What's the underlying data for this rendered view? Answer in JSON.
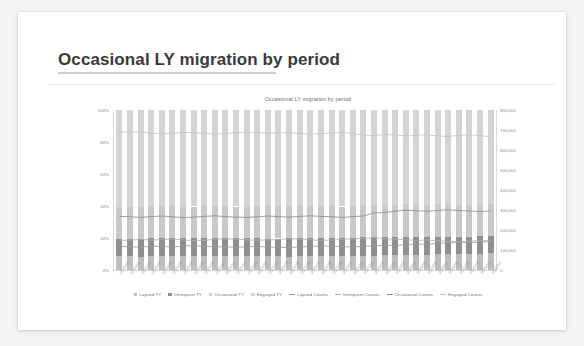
{
  "slide": {
    "title": "Occasional LY migration by period"
  },
  "chart_data": {
    "type": "bar",
    "title": "Occasional LY migration by period",
    "xlabel": "",
    "ylabel": "",
    "stacked": true,
    "grid": false,
    "legend_position": "bottom",
    "y_left": {
      "ticks": [
        "100%",
        "80%",
        "60%",
        "40%",
        "20%",
        "0%"
      ],
      "lim": [
        0,
        100
      ],
      "format": "percent"
    },
    "y_right": {
      "ticks": [
        "800,000",
        "700,000",
        "600,000",
        "500,000",
        "400,000",
        "300,000",
        "200,000",
        "100,000",
        "0"
      ],
      "lim": [
        0,
        800000
      ],
      "format": "counts"
    },
    "categories": [
      "202001",
      "202002",
      "202003",
      "202004",
      "202005",
      "202006",
      "202007",
      "202008",
      "202009",
      "202010",
      "202011",
      "202012",
      "202101",
      "202102",
      "202103",
      "202104",
      "202105",
      "202106",
      "202107",
      "202108",
      "202109",
      "202110",
      "202111",
      "202112",
      "202201",
      "202202",
      "202203",
      "202204",
      "202205",
      "202206",
      "202207",
      "202208",
      "202209",
      "202210",
      "202211",
      "202212"
    ],
    "series": [
      {
        "name": "Lapsed TY",
        "kind": "bar",
        "color": "#bdbdbd",
        "axis": "left",
        "values": [
          8.5,
          8.6,
          8.4,
          8.8,
          8.7,
          8.6,
          8.9,
          9.0,
          8.8,
          8.7,
          8.6,
          8.5,
          8.7,
          8.8,
          8.6,
          8.5,
          8.4,
          8.6,
          8.8,
          9.0,
          8.9,
          8.7,
          8.6,
          8.8,
          9.0,
          9.2,
          9.1,
          9.4,
          9.6,
          9.5,
          9.8,
          9.9,
          10.1,
          10.0,
          10.2,
          10.4
        ]
      },
      {
        "name": "Infrequent TY",
        "kind": "bar",
        "color": "#8f8f8f",
        "axis": "left",
        "values": [
          10.8,
          10.9,
          11.2,
          11.0,
          11.1,
          11.3,
          11.0,
          10.8,
          10.9,
          11.2,
          11.4,
          11.3,
          11.1,
          10.9,
          11.0,
          11.2,
          11.5,
          11.3,
          11.1,
          10.9,
          11.0,
          11.2,
          11.4,
          11.6,
          11.8,
          11.5,
          11.3,
          11.1,
          10.9,
          11.0,
          10.8,
          10.6,
          10.4,
          10.6,
          10.8,
          10.7
        ]
      },
      {
        "name": "Occasional TY",
        "kind": "bar",
        "color": "#c9c9c9",
        "axis": "left",
        "values": [
          20.2,
          20.0,
          19.8,
          20.1,
          20.3,
          20.0,
          19.7,
          19.9,
          20.2,
          20.4,
          20.1,
          19.9,
          19.8,
          20.0,
          20.3,
          20.1,
          19.9,
          20.2,
          20.4,
          20.2,
          20.0,
          19.8,
          20.1,
          20.3,
          20.0,
          19.8,
          20.2,
          20.5,
          20.3,
          20.1,
          20.4,
          20.6,
          20.3,
          20.1,
          19.9,
          20.2
        ]
      },
      {
        "name": "Engaged TY",
        "kind": "bar",
        "color": "#d4d4d4",
        "axis": "left",
        "values": [
          60.5,
          60.5,
          60.6,
          60.1,
          59.9,
          60.1,
          60.4,
          60.3,
          60.1,
          59.7,
          59.9,
          60.3,
          60.4,
          60.3,
          60.1,
          60.2,
          60.2,
          59.9,
          59.7,
          59.9,
          60.1,
          60.3,
          59.9,
          59.3,
          59.2,
          59.5,
          59.4,
          59.0,
          59.2,
          59.4,
          59.0,
          58.9,
          59.2,
          59.3,
          59.1,
          58.7
        ]
      },
      {
        "name": "Lapsed Counts",
        "kind": "line",
        "color": "#9a9a9a",
        "axis": "right",
        "values": [
          118000,
          116000,
          114000,
          119000,
          117000,
          115000,
          120000,
          122000,
          119000,
          117000,
          115000,
          114000,
          116000,
          118000,
          115000,
          113000,
          112000,
          115000,
          118000,
          121000,
          119000,
          117000,
          115000,
          118000,
          121000,
          124000,
          122000,
          127000,
          130000,
          128000,
          133000,
          135000,
          138000,
          136000,
          139000,
          142000
        ]
      },
      {
        "name": "Infrequent Counts",
        "kind": "line",
        "color": "#b0b0b0",
        "axis": "right",
        "values": [
          148000,
          149000,
          153000,
          150000,
          152000,
          154000,
          150000,
          147000,
          149000,
          153000,
          156000,
          154000,
          151000,
          149000,
          150000,
          153000,
          157000,
          154000,
          151000,
          148000,
          150000,
          153000,
          156000,
          158000,
          161000,
          157000,
          154000,
          151000,
          148000,
          150000,
          147000,
          144000,
          141000,
          144000,
          147000,
          146000
        ]
      },
      {
        "name": "Occasional Counts",
        "kind": "line",
        "color": "#8a8a8a",
        "axis": "right",
        "values": [
          268000,
          266000,
          263000,
          267000,
          270000,
          266000,
          262000,
          264000,
          268000,
          271000,
          267000,
          264000,
          263000,
          266000,
          270000,
          267000,
          264000,
          268000,
          271000,
          268000,
          266000,
          263000,
          267000,
          270000,
          285000,
          288000,
          294000,
          299000,
          296000,
          294000,
          298000,
          301000,
          297000,
          295000,
          292000,
          296000
        ]
      },
      {
        "name": "Engaged Counts",
        "kind": "line",
        "color": "#c4c4c4",
        "axis": "right",
        "values": [
          690000,
          689000,
          691000,
          684000,
          681000,
          684000,
          688000,
          687000,
          684000,
          679000,
          682000,
          687000,
          689000,
          687000,
          684000,
          686000,
          686000,
          682000,
          679000,
          682000,
          685000,
          688000,
          682000,
          674000,
          672000,
          677000,
          675000,
          670000,
          673000,
          676000,
          670000,
          668000,
          673000,
          675000,
          672000,
          666000
        ]
      }
    ],
    "legend": [
      {
        "label": "Lapsed TY",
        "marker": "square",
        "color": "#bdbdbd"
      },
      {
        "label": "Infrequent TY",
        "marker": "square",
        "color": "#8f8f8f"
      },
      {
        "label": "Occasional TY",
        "marker": "square",
        "color": "#c9c9c9"
      },
      {
        "label": "Engaged TY",
        "marker": "square",
        "color": "#d4d4d4"
      },
      {
        "label": "Lapsed Counts",
        "marker": "line",
        "color": "#9a9a9a"
      },
      {
        "label": "Infrequent Counts",
        "marker": "line",
        "color": "#b0b0b0"
      },
      {
        "label": "Occasional Counts",
        "marker": "line",
        "color": "#8a8a8a"
      },
      {
        "label": "Engaged Counts",
        "marker": "line",
        "color": "#c4c4c4"
      }
    ]
  }
}
